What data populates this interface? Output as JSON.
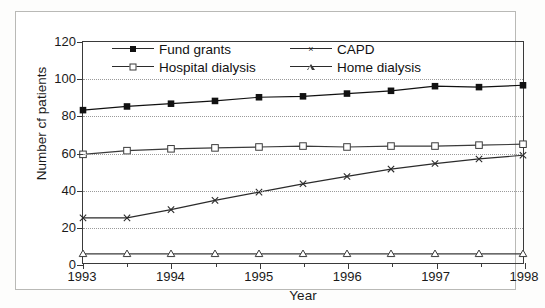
{
  "figure": {
    "background_color": "#ffffff",
    "frame_color": "#b9b9b6",
    "axis_color": "#3a3a3a",
    "grid_color": "#9a9a9a"
  },
  "chart_data": {
    "type": "line",
    "title": "",
    "xlabel": "Year",
    "ylabel": "Number cf patients",
    "xlim": [
      1993,
      1998
    ],
    "ylim": [
      0,
      120
    ],
    "ytick_labels": [
      "0",
      "20",
      "40",
      "60",
      "80",
      "100",
      "120"
    ],
    "yticks": [
      0,
      20,
      40,
      60,
      80,
      100,
      120
    ],
    "xtick_labels": [
      "1993",
      "1994",
      "1995",
      "1996",
      "1997",
      "1998"
    ],
    "xticks": [
      1993,
      1994,
      1995,
      1996,
      1997,
      1998
    ],
    "minor_xticks": [
      1993.5,
      1994.5,
      1995.5,
      1996.5,
      1997.5
    ],
    "grid": "horizontal-dotted",
    "legend_position": "top-inside",
    "x": [
      1993,
      1993.5,
      1994,
      1994.5,
      1995,
      1995.5,
      1996,
      1996.5,
      1997,
      1997.5,
      1998
    ],
    "series": [
      {
        "name": "Fund grants",
        "marker": "filled-square",
        "color": "#111111",
        "values": [
          83,
          85,
          86.5,
          88,
          90,
          90.5,
          92,
          93.5,
          96,
          95.5,
          96.5
        ]
      },
      {
        "name": "Hospital dialysis",
        "marker": "open-square",
        "color": "#3a3a3a",
        "values": [
          59,
          61,
          62,
          62.5,
          63,
          63.5,
          63,
          63.5,
          63.5,
          64,
          64.5
        ]
      },
      {
        "name": "CAPD",
        "marker": "cross",
        "color": "#2b2b2b",
        "values": [
          24.5,
          24.5,
          29,
          34,
          38.5,
          43,
          47,
          51,
          54,
          56.5,
          58.5
        ]
      },
      {
        "name": "Home dialysis",
        "marker": "open-triangle",
        "color": "#3a3a3a",
        "values": [
          5,
          5,
          5,
          5,
          5,
          5,
          5,
          5,
          5,
          5,
          5
        ]
      }
    ]
  },
  "legend": {
    "entries": [
      {
        "label": "Fund grants",
        "marker": "filled-square"
      },
      {
        "label": "CAPD",
        "marker": "cross"
      },
      {
        "label": "Hospital dialysis",
        "marker": "open-square"
      },
      {
        "label": "Home dialysis",
        "marker": "open-triangle"
      }
    ]
  }
}
